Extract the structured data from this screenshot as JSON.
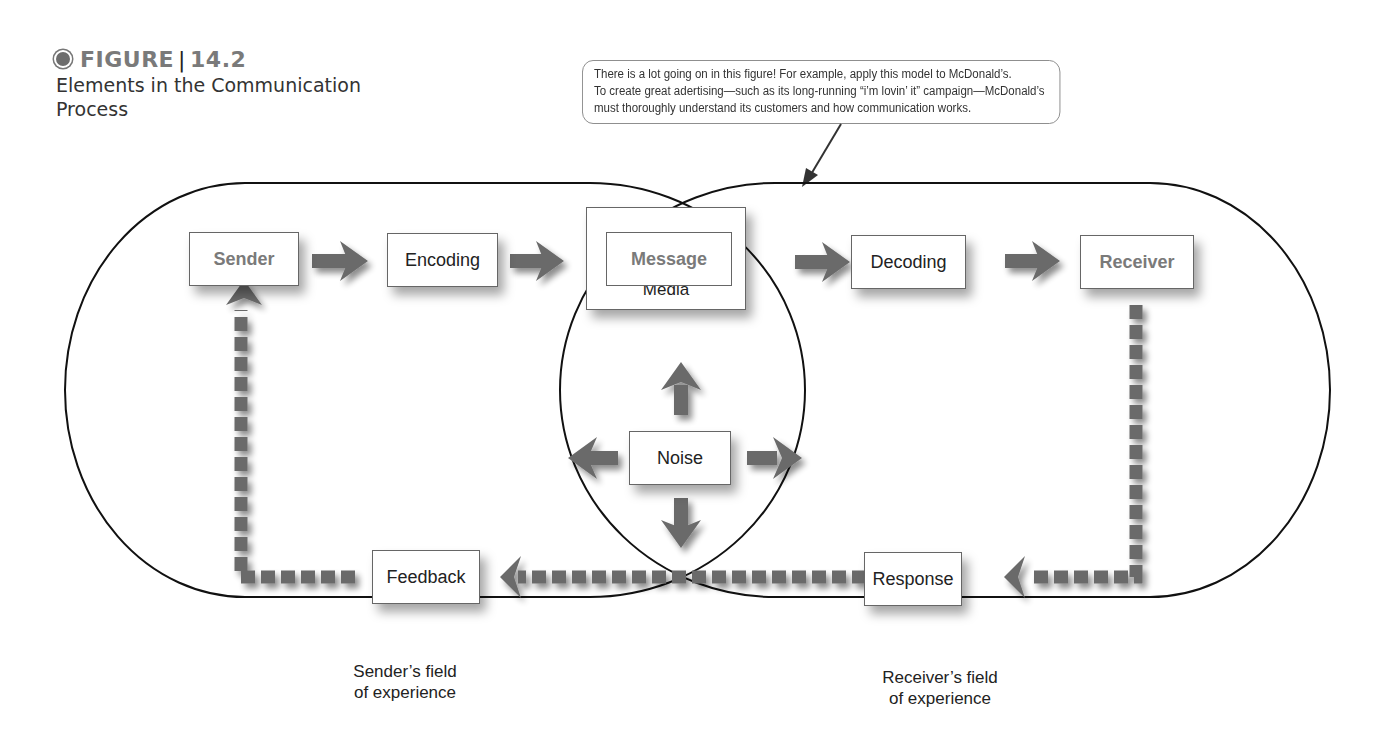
{
  "figure": {
    "label": "FIGURE",
    "number": "14.2",
    "title": "Elements in the Communication Process"
  },
  "callout": {
    "lines": [
      "There is a lot going on in this figure!  For example, apply this model to McDonald’s.",
      "To create great adertising—such as its long-running “i’m lovin’ it” campaign—McDonald’s",
      "must thoroughly understand its customers and how communication works."
    ]
  },
  "nodes": {
    "sender": "Sender",
    "encoding": "Encoding",
    "message": "Message",
    "media": "Media",
    "decoding": "Decoding",
    "receiver": "Receiver",
    "noise": "Noise",
    "response": "Response",
    "feedback": "Feedback"
  },
  "fields": {
    "sender": [
      "Sender’s field",
      "of experience"
    ],
    "receiver": [
      "Receiver’s field",
      "of experience"
    ]
  },
  "colors": {
    "arrow": "#6b6b6b",
    "outline": "#111111",
    "label_grey": "#7a7a7a"
  }
}
